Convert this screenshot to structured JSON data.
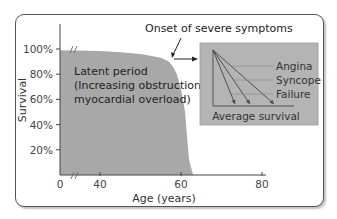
{
  "chart_data": {
    "type": "area",
    "title": "",
    "xlabel": "Age (years)",
    "ylabel": "Survival",
    "x_ticks": [
      {
        "value": 0,
        "label": "0"
      },
      {
        "value": 40,
        "label": "40"
      },
      {
        "value": 60,
        "label": "60"
      },
      {
        "value": 80,
        "label": "80"
      }
    ],
    "y_ticks": [
      {
        "value": 20,
        "label": "20%"
      },
      {
        "value": 40,
        "label": "40%"
      },
      {
        "value": 60,
        "label": "60%"
      },
      {
        "value": 80,
        "label": "80%"
      },
      {
        "value": 100,
        "label": "100%"
      }
    ],
    "axis_break": "x-axis break between 0 and 40; curve break at start",
    "xlim": [
      30,
      80
    ],
    "ylim": [
      0,
      100
    ],
    "series": [
      {
        "name": "Survival",
        "x": [
          30,
          40,
          45,
          50,
          55,
          57,
          58,
          59,
          60,
          61,
          61.5,
          62,
          63
        ],
        "y": [
          99,
          98.5,
          97.5,
          96,
          93,
          90,
          86,
          80,
          68,
          50,
          30,
          12,
          0
        ],
        "fill": "#a8a8a8"
      }
    ],
    "annotations": {
      "latent_period": [
        "Latent period",
        "(Increasing obstruction,",
        "myocardial overload)"
      ],
      "onset": "Onset of severe symptoms"
    },
    "inset": {
      "title": "Average survival",
      "lines": [
        {
          "label": "Angina",
          "order": 3
        },
        {
          "label": "Syncope",
          "order": 2
        },
        {
          "label": "Failure",
          "order": 1
        }
      ],
      "background": "#b4b4b4"
    }
  }
}
